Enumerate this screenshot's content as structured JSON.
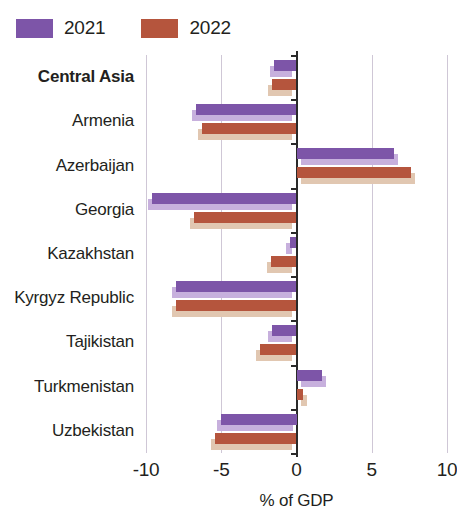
{
  "legend": {
    "items": [
      {
        "label": "2021",
        "color": "#7d55a8",
        "shadow_color": "#c7b0dd"
      },
      {
        "label": "2022",
        "color": "#b5553d",
        "shadow_color": "#e1c7b1"
      }
    ]
  },
  "axis": {
    "xlabel": "% of GDP",
    "ticks": [
      "-10",
      "-5",
      "0",
      "5",
      "10"
    ]
  },
  "categories": {
    "c0": "Central Asia",
    "c1": "Armenia",
    "c2": "Azerbaijan",
    "c3": "Georgia",
    "c4": "Kazakhstan",
    "c5": "Kyrgyz Republic",
    "c6": "Tajikistan",
    "c7": "Turkmenistan",
    "c8": "Uzbekistan"
  },
  "chart_data": {
    "type": "bar",
    "orientation": "horizontal",
    "title": "",
    "subtitle": "",
    "xlabel": "% of GDP",
    "ylabel": "",
    "xlim": [
      -10,
      10
    ],
    "xticks": [
      -10,
      -5,
      0,
      5,
      10
    ],
    "grid": true,
    "legend_position": "top-left",
    "categories": [
      "Central Asia",
      "Armenia",
      "Azerbaijan",
      "Georgia",
      "Kazakhstan",
      "Kyrgyz Republic",
      "Tajikistan",
      "Turkmenistan",
      "Uzbekistan"
    ],
    "series": [
      {
        "name": "2021",
        "color": "#7d55a8",
        "values": [
          -1.5,
          -6.7,
          6.5,
          -9.6,
          -0.4,
          -8.0,
          -1.6,
          1.7,
          -5.0
        ]
      },
      {
        "name": "2022",
        "color": "#b5553d",
        "values": [
          -1.6,
          -6.3,
          7.6,
          -6.8,
          -1.7,
          -8.0,
          -2.4,
          0.4,
          -5.4
        ]
      }
    ]
  }
}
